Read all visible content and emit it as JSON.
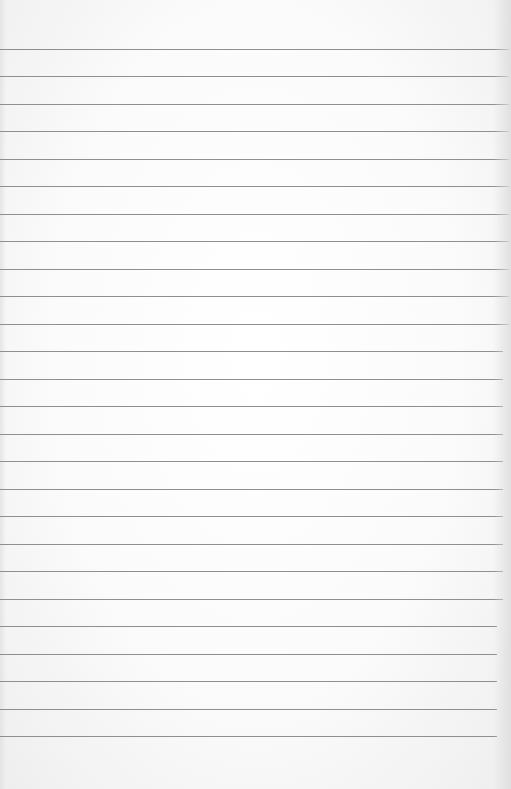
{
  "image": {
    "subject": "blank lined notebook paper",
    "text_content": "",
    "line_count": 26,
    "colors": {
      "paper": "#fafafa",
      "rule_line": "#8f8f8f"
    }
  }
}
